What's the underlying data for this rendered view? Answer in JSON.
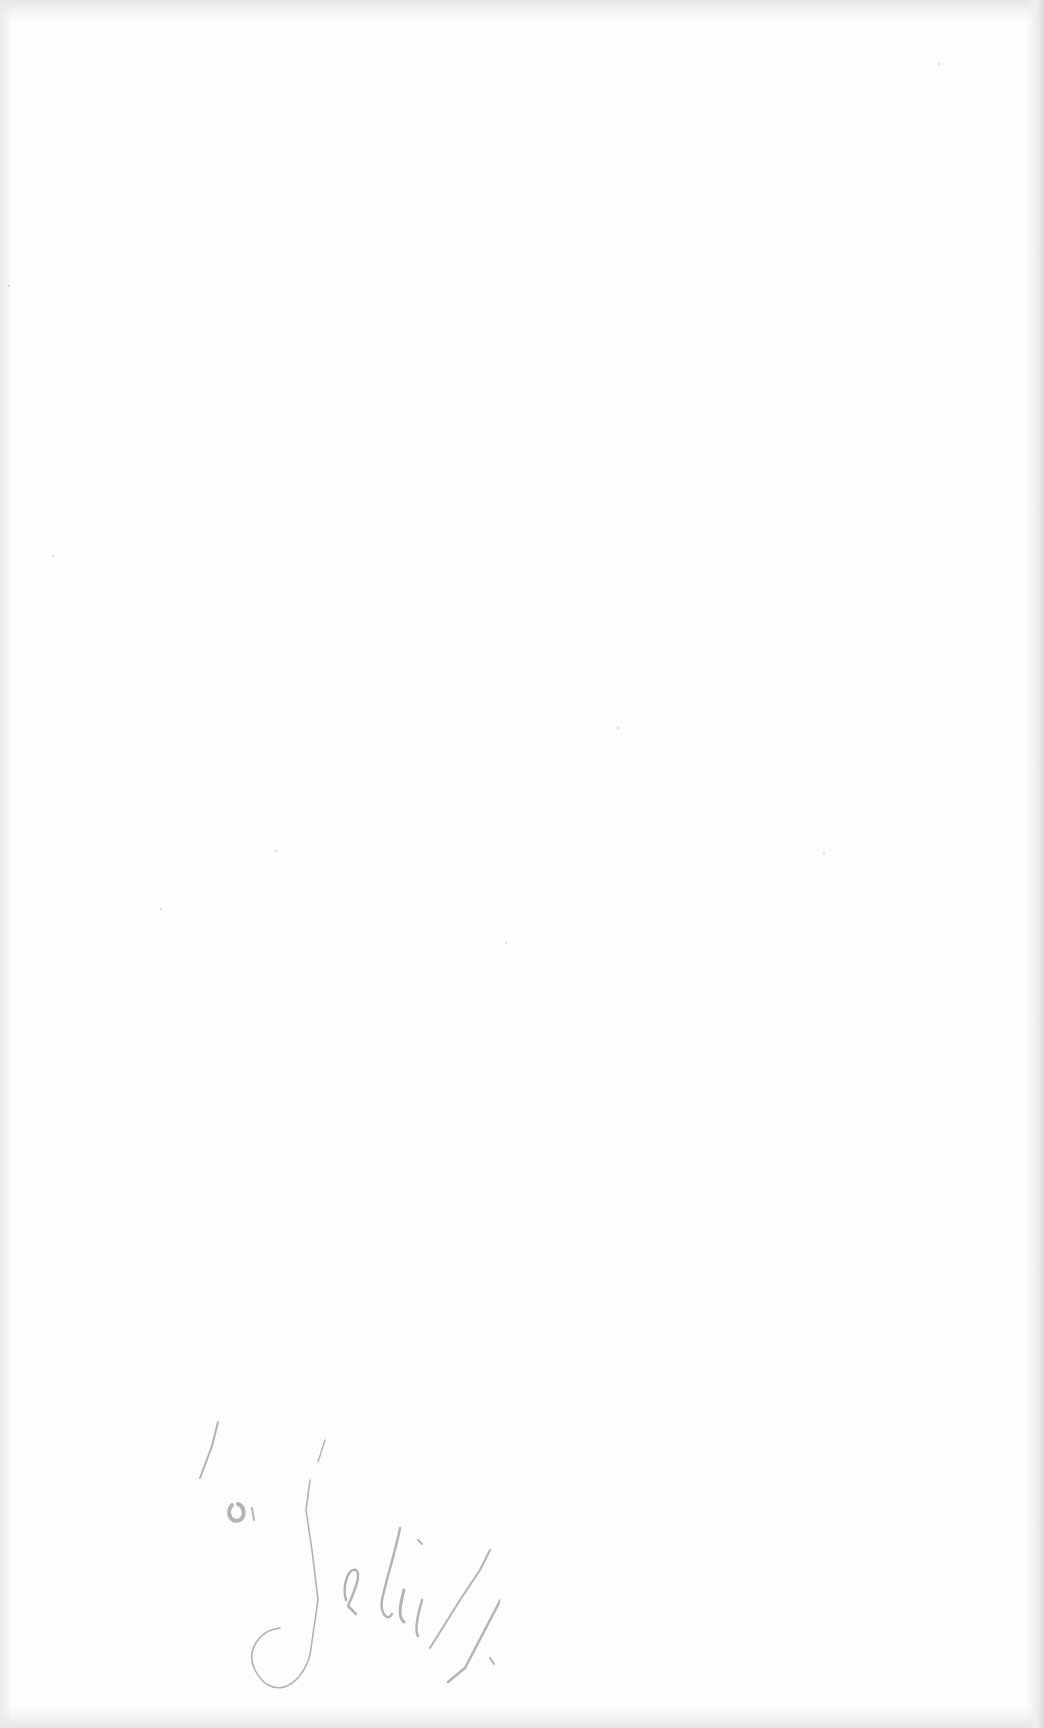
{
  "document": {
    "type": "blank scanned page",
    "paper_color": "#fdfdfd",
    "annotation": {
      "kind": "handwritten pencil signature",
      "text": "Zeliff",
      "ink_color": "#9a9a9a",
      "position": "lower-left"
    }
  }
}
